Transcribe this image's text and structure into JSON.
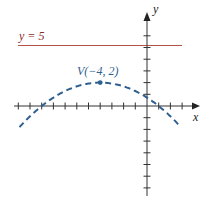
{
  "diagram": {
    "line_label": "y = 5",
    "vertex_label": "V(−4, 2)",
    "x_axis_label": "x",
    "y_axis_label": "y",
    "colors": {
      "line": "#b5524a",
      "parabola": "#2f5f8f",
      "axis": "#333333"
    },
    "horizontal_line_y": 5,
    "vertex": [
      -4,
      2
    ],
    "parabola": "y = -0.08(x+4)^2 + 2",
    "x_ticks": [
      -11,
      -10,
      -9,
      -8,
      -7,
      -6,
      -5,
      -4,
      -3,
      -2,
      -1,
      1,
      2,
      3
    ],
    "y_ticks": [
      -7,
      -6,
      -5,
      -4,
      -3,
      -2,
      -1,
      1,
      2,
      3,
      4,
      5,
      6
    ]
  }
}
